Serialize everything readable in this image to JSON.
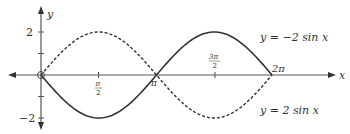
{
  "chart_data": {
    "type": "line",
    "title": "",
    "xlabel": "x",
    "ylabel": "y",
    "x_ticks": [
      "π/2",
      "π",
      "3π/2",
      "2π"
    ],
    "x_tick_values": [
      1.5708,
      3.1416,
      4.7124,
      6.2832
    ],
    "y_ticks": [
      "2",
      "−2"
    ],
    "y_tick_values": [
      2,
      -2
    ],
    "xlim": [
      0,
      6.2832
    ],
    "ylim": [
      -2,
      2
    ],
    "grid": false,
    "series": [
      {
        "name": "y = −2 sin x",
        "style": "solid",
        "x": [
          0,
          1.5708,
          3.1416,
          4.7124,
          6.2832
        ],
        "values": [
          0,
          -2,
          0,
          2,
          0
        ]
      },
      {
        "name": "y = 2 sin x",
        "style": "dashed",
        "x": [
          0,
          1.5708,
          3.1416,
          4.7124,
          6.2832
        ],
        "values": [
          0,
          2,
          0,
          -2,
          0
        ]
      }
    ],
    "annotations": [
      {
        "text": "y = −2 sin x",
        "near": "solid curve peak at 3π/2"
      },
      {
        "text": "y = 2 sin x",
        "near": "dashed curve trough at 3π/2"
      }
    ]
  },
  "labels": {
    "x_axis": "x",
    "y_axis": "y",
    "y_tick_pos": "2",
    "y_tick_neg": "−2",
    "tick_pi_half_num": "π",
    "tick_pi_half_den": "2",
    "tick_pi": "π",
    "tick_3pi_half_num": "3π",
    "tick_3pi_half_den": "2",
    "tick_2pi": "2π",
    "series_solid_label": "y = −2 sin x",
    "series_dashed_label": "y = 2 sin x"
  }
}
